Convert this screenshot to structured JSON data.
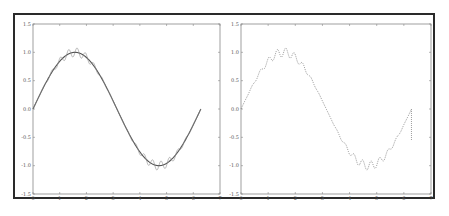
{
  "chart_data": [
    {
      "type": "line",
      "title": "",
      "xlabel": "",
      "ylabel": "",
      "xlim": [
        0,
        7
      ],
      "ylim": [
        -1.5,
        1.5
      ],
      "x_ticks": [
        "0",
        "1",
        "2",
        "3",
        "4",
        "5",
        "6",
        "7"
      ],
      "y_ticks": [
        "-1.5",
        "-1.0",
        "-0.5",
        "0.0",
        "0.5",
        "1.0",
        "1.5"
      ],
      "grid": false,
      "legend": null,
      "series": [
        {
          "name": "sin(x)",
          "style": "solid",
          "x_range": [
            0,
            6.283
          ],
          "function": "sin(x)"
        },
        {
          "name": "sin(x) + ripple",
          "style": "solid-thin",
          "x_range": [
            0,
            6.283
          ],
          "function": "sin(x) + 0.08*sin(20x)*|sin(x)|^2"
        }
      ]
    },
    {
      "type": "line",
      "title": "",
      "xlabel": "",
      "ylabel": "",
      "xlim": [
        0,
        7
      ],
      "ylim": [
        -1.5,
        1.5
      ],
      "x_ticks": [
        "0",
        "1",
        "2",
        "3",
        "4",
        "5",
        "6",
        "7"
      ],
      "y_ticks": [
        "-1.5",
        "-1.0",
        "-0.5",
        "0.0",
        "0.5",
        "1.0",
        "1.5"
      ],
      "grid": false,
      "legend": null,
      "series": [
        {
          "name": "noisy sin(x)",
          "style": "dotted",
          "x_range": [
            0,
            6.283
          ],
          "function": "sin(x) + 0.08*sin(20x)*|sin(x)|^2"
        },
        {
          "name": "vertical segment",
          "style": "dotted",
          "x": [
            6.28,
            6.28
          ],
          "y": [
            0.0,
            -0.55
          ]
        }
      ]
    }
  ]
}
